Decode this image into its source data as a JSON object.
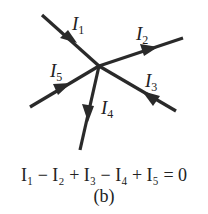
{
  "labels": {
    "i1": {
      "sym": "I",
      "sub": "1"
    },
    "i2": {
      "sym": "I",
      "sub": "2"
    },
    "i3": {
      "sym": "I",
      "sub": "3"
    },
    "i4": {
      "sym": "I",
      "sub": "4"
    },
    "i5": {
      "sym": "I",
      "sub": "5"
    }
  },
  "equation": "I₁ − I₂ + I₃ − I₄ + I₅ = 0",
  "caption": "(b)",
  "colors": {
    "line": "#2a2a2a"
  }
}
